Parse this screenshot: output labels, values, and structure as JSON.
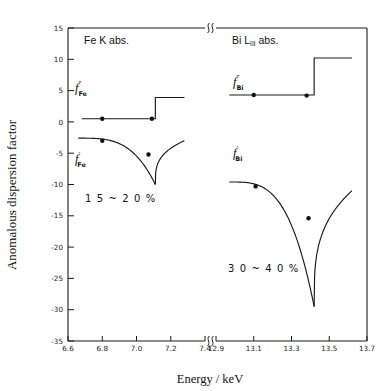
{
  "chart_data": {
    "type": "line",
    "title": "",
    "xlabel": "Energy / keV",
    "ylabel": "Anomalous dispersion factor",
    "axis_break": true,
    "ylim": [
      -35,
      15
    ],
    "y_ticks": [
      "15",
      "10",
      "5",
      "0",
      "-5",
      "-10",
      "-15",
      "-20",
      "-25",
      "-30",
      "-35"
    ],
    "y_tick_values": [
      15,
      10,
      5,
      0,
      -5,
      -10,
      -15,
      -20,
      -25,
      -30,
      -35
    ],
    "panels": [
      {
        "id": "fe",
        "title": "Fe K abs.",
        "title_main": "Fe K abs.",
        "xlim": [
          6.6,
          7.4
        ],
        "x_ticks": [
          "6.6",
          "6.8",
          "7.0",
          "7.2",
          "7.4"
        ],
        "x_tick_values": [
          6.6,
          6.8,
          7.0,
          7.2,
          7.4
        ],
        "edge_energy": 7.11,
        "annotation": "1 5 ~ 2 0 %",
        "series": [
          {
            "name": "f''_Fe",
            "label_base": "f",
            "label_prime": "″",
            "label_sub": "Fe",
            "kind": "imaginary",
            "pre_edge_value": 0.5,
            "post_edge_value": 3.9,
            "x_start": 6.68,
            "x_end": 7.28,
            "markers": [
              {
                "x": 6.8,
                "y": 0.5
              },
              {
                "x": 7.09,
                "y": 0.5
              }
            ]
          },
          {
            "name": "f'_Fe",
            "label_base": "f",
            "label_prime": "′",
            "label_sub": "Fe",
            "kind": "real",
            "far_pre_value": -2.6,
            "min_value": -10.0,
            "post_edge_value": -3.0,
            "x_start": 6.66,
            "x_end": 7.28,
            "markers": [
              {
                "x": 6.8,
                "y": -3.0
              },
              {
                "x": 7.07,
                "y": -5.2
              }
            ]
          }
        ]
      },
      {
        "id": "bi",
        "title": "Bi L III abs.",
        "title_main": "Bi L",
        "title_sub": "III",
        "title_tail": " abs.",
        "xlim": [
          12.9,
          13.7
        ],
        "x_ticks": [
          "12.9",
          "13.1",
          "13.3",
          "13.5",
          "13.7"
        ],
        "x_tick_values": [
          12.9,
          13.1,
          13.3,
          13.5,
          13.7
        ],
        "edge_energy": 13.42,
        "annotation": "3 0 ~ 4 0 %",
        "series": [
          {
            "name": "f''_Bi",
            "label_base": "f",
            "label_prime": "″",
            "label_sub": "Bi",
            "kind": "imaginary",
            "pre_edge_value": 4.3,
            "post_edge_value": 10.2,
            "x_start": 12.97,
            "x_end": 13.62,
            "markers": [
              {
                "x": 13.1,
                "y": 4.3
              },
              {
                "x": 13.38,
                "y": 4.2
              }
            ]
          },
          {
            "name": "f'_Bi",
            "label_base": "f",
            "label_prime": "′",
            "label_sub": "Bi",
            "kind": "real",
            "far_pre_value": -9.6,
            "min_value": -29.5,
            "post_edge_value": -11.0,
            "x_start": 12.97,
            "x_end": 13.62,
            "markers": [
              {
                "x": 13.11,
                "y": -10.3
              },
              {
                "x": 13.39,
                "y": -15.4
              }
            ]
          }
        ]
      }
    ]
  },
  "axis": {
    "y_title": "Anomalous dispersion factor",
    "x_title": "Energy / keV"
  }
}
